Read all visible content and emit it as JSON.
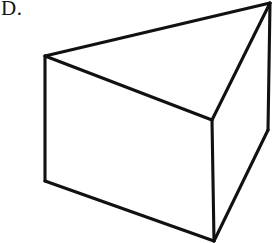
{
  "page": {
    "background_color": "#ffffff",
    "width": 276,
    "height": 243
  },
  "choice": {
    "label": "D."
  },
  "figure": {
    "name": "triangular-prism",
    "line_color": "#111111",
    "fill_color": "#ffffff",
    "stroke_width": 3.1,
    "hidden_stroke_width": 2.6,
    "hidden_dash_pattern": "11 9",
    "vertices": {
      "front_top_left": [
        45,
        56
      ],
      "front_top_right": [
        270,
        3
      ],
      "front_bottom_mid": [
        212,
        120
      ],
      "back_bottom_left": [
        45,
        181
      ],
      "back_bottom_point": [
        214,
        241
      ],
      "back_right": [
        268,
        130
      ]
    },
    "edges": [
      {
        "name": "top-left-to-top-right",
        "from": "front_top_left",
        "to": "front_top_right",
        "style": "solid"
      },
      {
        "name": "top-right-to-mid",
        "from": "front_top_right",
        "to": "front_bottom_mid",
        "style": "solid"
      },
      {
        "name": "mid-to-top-left",
        "from": "front_bottom_mid",
        "to": "front_top_left",
        "style": "solid"
      },
      {
        "name": "top-left-to-bottom-left",
        "from": "front_top_left",
        "to": "back_bottom_left",
        "style": "solid"
      },
      {
        "name": "mid-to-bottom-point",
        "from": "front_bottom_mid",
        "to": "back_bottom_point",
        "style": "solid"
      },
      {
        "name": "top-right-to-back-right",
        "from": "front_top_right",
        "to": "back_right",
        "style": "solid"
      },
      {
        "name": "bottom-left-to-bottom-point",
        "from": "back_bottom_left",
        "to": "back_bottom_point",
        "style": "solid"
      },
      {
        "name": "bottom-point-to-back-right",
        "from": "back_bottom_point",
        "to": "back_right",
        "style": "solid"
      },
      {
        "name": "hidden-bottom-left-to-back-right",
        "from": "back_bottom_left",
        "to": "back_right",
        "style": "dashed"
      }
    ]
  }
}
